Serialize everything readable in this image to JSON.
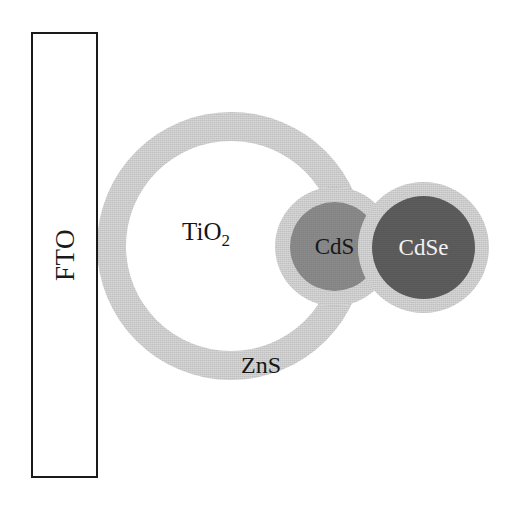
{
  "diagram": {
    "background_color": "#ffffff",
    "width": 519,
    "height": 510
  },
  "substrate": {
    "label": "FTO",
    "fill_color": "#ffffff",
    "border_color": "#1a1a1a",
    "orientation": "vertical-rotated-label"
  },
  "particles": [
    {
      "id": "tio2",
      "label": "TiO",
      "subscript": "2",
      "full_label": "TiO2",
      "core_color": "#ffffff",
      "shell_color": "#d6d6d6",
      "role": "mesoporous oxide scaffold"
    },
    {
      "id": "cds",
      "label": "CdS",
      "core_color": "#8b8b8b",
      "shell_color": "#d6d6d6",
      "label_color": "#181818",
      "role": "quantum dot sensitizer"
    },
    {
      "id": "cdse",
      "label": "CdSe",
      "core_color": "#5d5d5d",
      "shell_color": "#d6d6d6",
      "label_color": "#f2f2f2",
      "role": "quantum dot sensitizer"
    }
  ],
  "shell": {
    "label": "ZnS",
    "color": "#d6d6d6",
    "label_color": "#141414",
    "role": "passivation overlayer"
  }
}
